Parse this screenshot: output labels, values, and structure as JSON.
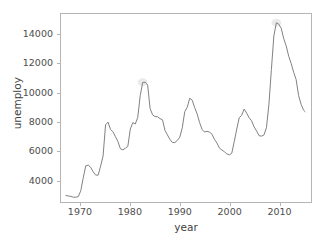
{
  "chart_data": {
    "type": "line",
    "title": "",
    "xlabel": "year",
    "ylabel": "unemploy",
    "xlim": [
      1966.0,
      2016.5
    ],
    "ylim": [
      2500,
      15400
    ],
    "xticks": [
      1970,
      1980,
      1990,
      2000,
      2010
    ],
    "yticks": [
      4000,
      6000,
      8000,
      10000,
      12000,
      14000
    ],
    "xtick_labels": [
      "1970",
      "1980",
      "1990",
      "2000",
      "2010"
    ],
    "ytick_labels": [
      "4000",
      "6000",
      "8000",
      "10000",
      "12000",
      "14000"
    ],
    "grid": false,
    "legend": "none",
    "line_color": "#808080",
    "line_width": 1.0,
    "band_color": "#d9d9d9",
    "axes_color": "#b5b5b5",
    "tick_color": "#4d4d4d",
    "background": "#ffffff",
    "series": [
      {
        "name": "unemploy",
        "x": [
          1967.0,
          1967.5,
          1968.0,
          1968.5,
          1969.0,
          1969.5,
          1970.0,
          1970.5,
          1971.0,
          1971.5,
          1972.0,
          1972.5,
          1973.0,
          1973.5,
          1974.0,
          1974.5,
          1975.0,
          1975.5,
          1976.0,
          1976.5,
          1977.0,
          1977.5,
          1978.0,
          1978.5,
          1979.0,
          1979.5,
          1980.0,
          1980.5,
          1981.0,
          1981.5,
          1982.0,
          1982.5,
          1983.0,
          1983.5,
          1984.0,
          1984.5,
          1985.0,
          1985.5,
          1986.0,
          1986.5,
          1987.0,
          1987.5,
          1988.0,
          1988.5,
          1989.0,
          1989.5,
          1990.0,
          1990.5,
          1991.0,
          1991.5,
          1992.0,
          1992.5,
          1993.0,
          1993.5,
          1994.0,
          1994.5,
          1995.0,
          1995.5,
          1996.0,
          1996.5,
          1997.0,
          1997.5,
          1998.0,
          1998.5,
          1999.0,
          1999.5,
          2000.0,
          2000.5,
          2001.0,
          2001.5,
          2002.0,
          2002.5,
          2003.0,
          2003.5,
          2004.0,
          2004.5,
          2005.0,
          2005.5,
          2006.0,
          2006.5,
          2007.0,
          2007.5,
          2008.0,
          2008.5,
          2009.0,
          2009.5,
          2010.0,
          2010.5,
          2011.0,
          2011.5,
          2012.0,
          2012.5,
          2013.0,
          2013.5,
          2014.0,
          2014.5,
          2015.0,
          2015.3
        ],
        "y": [
          2944,
          2912,
          2880,
          2830,
          2830,
          2870,
          3280,
          4180,
          4980,
          5030,
          4880,
          4570,
          4350,
          4340,
          4960,
          5660,
          7800,
          7980,
          7480,
          7320,
          6980,
          6650,
          6150,
          6080,
          6190,
          6320,
          7500,
          7950,
          7850,
          8300,
          9800,
          10700,
          10720,
          10530,
          8920,
          8480,
          8360,
          8350,
          8220,
          8140,
          7420,
          7100,
          6800,
          6580,
          6580,
          6720,
          6950,
          7600,
          8700,
          9000,
          9620,
          9490,
          8980,
          8540,
          7950,
          7480,
          7300,
          7350,
          7300,
          7150,
          6800,
          6550,
          6200,
          6070,
          5950,
          5800,
          5730,
          5850,
          6650,
          7500,
          8280,
          8450,
          8880,
          8600,
          8280,
          8070,
          7660,
          7380,
          7050,
          7020,
          7100,
          7600,
          9200,
          11600,
          13900,
          14800,
          14700,
          14400,
          13700,
          13200,
          12500,
          12000,
          11400,
          10900,
          9800,
          9200,
          8800,
          8700
        ]
      }
    ],
    "annotations": [
      {
        "label": "peak-1982",
        "x": 1982.5,
        "y": 10720
      },
      {
        "label": "peak-2009",
        "x": 2009.5,
        "y": 14800
      },
      {
        "label": "trough-2000",
        "x": 2000.0,
        "y": 5730
      },
      {
        "label": "start-1967",
        "x": 1967.0,
        "y": 2944
      }
    ]
  },
  "axis": {
    "xlabel": "year",
    "ylabel": "unemploy"
  }
}
